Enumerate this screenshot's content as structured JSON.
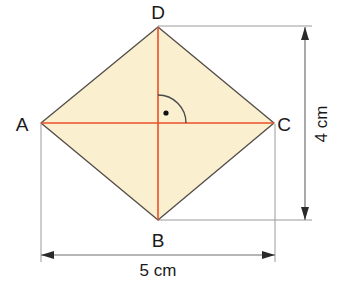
{
  "figure": {
    "kind": "geometry-diagram",
    "shape_name": "rhombus",
    "canvas": {
      "width": 340,
      "height": 282
    },
    "colors": {
      "fill": "#faefcf",
      "outline": "#55504a",
      "diagonal": "#e8502a",
      "dimension_line": "#7a7a7a",
      "extension_line": "#9a9a9a",
      "text": "#1a1a1a",
      "angle_marker": "#4a4a4a",
      "background": "#ffffff"
    },
    "vertices": [
      {
        "id": "A",
        "label": "A",
        "x": 41,
        "y": 123,
        "label_x": 22,
        "label_y": 131
      },
      {
        "id": "B",
        "label": "B",
        "x": 158,
        "y": 220,
        "label_x": 151,
        "label_y": 247
      },
      {
        "id": "C",
        "label": "C",
        "x": 274,
        "y": 123,
        "label_x": 283,
        "label_y": 131
      },
      {
        "id": "D",
        "label": "D",
        "x": 158,
        "y": 27,
        "label_x": 151,
        "label_y": 19
      }
    ],
    "center": {
      "x": 158,
      "y": 123
    },
    "diagonals": [
      {
        "id": "AC",
        "from": "A",
        "to": "C",
        "orientation": "horizontal"
      },
      {
        "id": "DB",
        "from": "D",
        "to": "B",
        "orientation": "vertical"
      }
    ],
    "angle_marker": {
      "type": "right-angle-arc-with-dot",
      "radius": 28,
      "dot_x": 166,
      "dot_y": 113
    },
    "dimensions": [
      {
        "id": "height",
        "label": "4 cm",
        "orientation": "vertical",
        "axis_x": 305,
        "from_y": 27,
        "to_y": 220,
        "label_x": 327,
        "label_y": 124,
        "measures": "D to B (vertical diagonal)"
      },
      {
        "id": "width",
        "label": "5 cm",
        "orientation": "horizontal",
        "axis_y": 255,
        "from_x": 41,
        "to_x": 275,
        "label_x": 158,
        "label_y": 276,
        "measures": "A to C (horizontal diagonal)"
      }
    ],
    "extension_lines": [
      {
        "id": "from-D-right",
        "x1": 158,
        "y1": 26,
        "x2": 312,
        "y2": 26
      },
      {
        "id": "from-B-right",
        "x1": 158,
        "y1": 220,
        "x2": 312,
        "y2": 220
      },
      {
        "id": "from-A-down",
        "x1": 41,
        "y1": 124,
        "x2": 41,
        "y2": 262
      },
      {
        "id": "from-C-down",
        "x1": 275,
        "y1": 124,
        "x2": 275,
        "y2": 262
      }
    ]
  }
}
